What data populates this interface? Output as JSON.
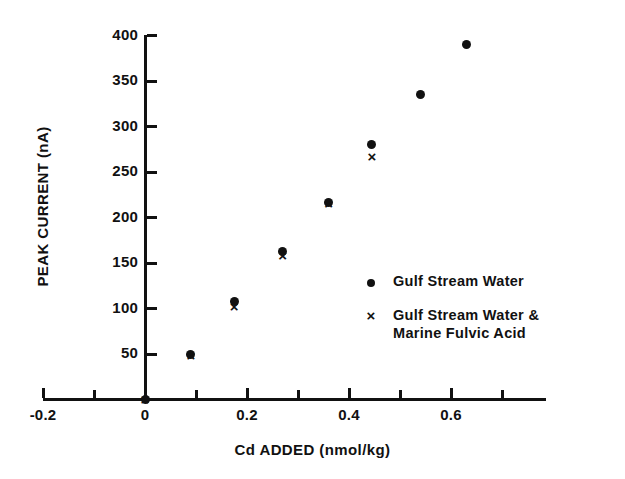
{
  "chart_data": {
    "type": "scatter",
    "title": "",
    "xlabel": "Cd ADDED (nmol/kg)",
    "ylabel": "PEAK CURRENT (nA)",
    "xlim": [
      -0.2,
      0.7
    ],
    "ylim": [
      0,
      400
    ],
    "grid": false,
    "legend_position": "inside-right",
    "x_ticks_major": [
      "-0.2",
      "0",
      "0.2",
      "0.4",
      "0.6"
    ],
    "x_tick_values_major": [
      -0.2,
      0,
      0.2,
      0.4,
      0.6
    ],
    "x_tick_values_minor": [
      -0.1,
      0.1,
      0.3,
      0.5,
      0.7
    ],
    "y_ticks": [
      "50",
      "100",
      "150",
      "200",
      "250",
      "300",
      "350",
      "400"
    ],
    "y_tick_values": [
      50,
      100,
      150,
      200,
      250,
      300,
      350,
      400
    ],
    "series": [
      {
        "name": "Gulf Stream Water",
        "marker": "dot",
        "color": "#111111",
        "x": [
          0,
          0.09,
          0.175,
          0.27,
          0.36,
          0.445,
          0.54,
          0.63
        ],
        "y": [
          0,
          49,
          108,
          163,
          217,
          280,
          335,
          390
        ]
      },
      {
        "name": "Gulf Stream Water & Marine Fulvic Acid",
        "marker": "cross",
        "color": "#111111",
        "x": [
          0,
          0.09,
          0.175,
          0.27,
          0.36,
          0.445
        ],
        "y": [
          0,
          48,
          102,
          158,
          215,
          267
        ]
      }
    ]
  },
  "legend": {
    "entries": [
      {
        "marker_symbol": "dot",
        "label": "Gulf Stream Water",
        "label_line2": ""
      },
      {
        "marker_symbol": "cross",
        "label": "Gulf Stream Water &",
        "label_line2": "Marine Fulvic Acid"
      }
    ]
  },
  "colors": {
    "ink": "#111111",
    "background": "#ffffff"
  }
}
